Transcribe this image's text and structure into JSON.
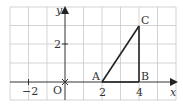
{
  "diagram": {
    "type": "coordinate-plane",
    "axes": {
      "x_label": "x",
      "y_label": "y",
      "origin_label": "O",
      "x_ticks": [
        {
          "value": -2,
          "label": "−2"
        },
        {
          "value": 2,
          "label": "2"
        },
        {
          "value": 4,
          "label": "4"
        }
      ],
      "y_ticks": [
        {
          "value": 2,
          "label": "2"
        }
      ]
    },
    "points": [
      {
        "name": "A",
        "x": 2,
        "y": 0
      },
      {
        "name": "B",
        "x": 4,
        "y": 0
      },
      {
        "name": "C",
        "x": 4,
        "y": 3
      }
    ],
    "segments": [
      [
        "A",
        "B"
      ],
      [
        "B",
        "C"
      ],
      [
        "A",
        "C"
      ]
    ],
    "colors": {
      "grid": "#c8c8c8",
      "axis": "#333333",
      "triangle": "#222222"
    }
  }
}
